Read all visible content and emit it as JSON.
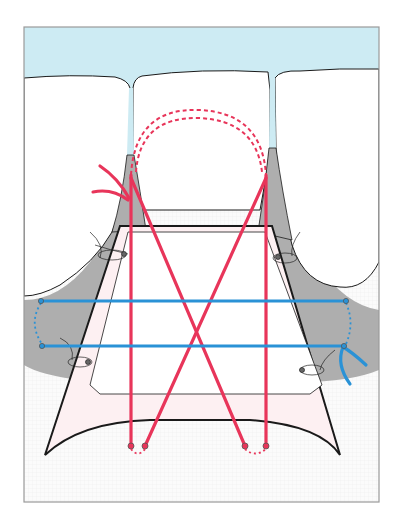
{
  "figure": {
    "colors": {
      "gingiva_band": "#cdebf3",
      "papilla_gray": "#aeaeae",
      "tooth_white": "#ffffff",
      "flap_fill": "#fdf0f2",
      "suture_red": "#e8355a",
      "suture_blue": "#2a92d6",
      "outline": "#1a1a1a",
      "frame": "#9a9a9a",
      "background_dots": "#f4f4f4"
    },
    "labels": []
  }
}
